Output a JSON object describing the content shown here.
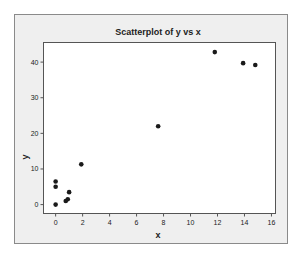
{
  "chart_data": {
    "type": "scatter",
    "title": "Scatterplot of y vs x",
    "xlabel": "x",
    "ylabel": "y",
    "xlim": [
      -0.9,
      16.3
    ],
    "ylim": [
      -2.5,
      45.5
    ],
    "xticks": [
      0,
      2,
      4,
      6,
      8,
      10,
      12,
      14,
      16
    ],
    "yticks": [
      0,
      10,
      20,
      30,
      40
    ],
    "grid": false,
    "legend": null,
    "series": [
      {
        "name": "y vs x",
        "points": [
          {
            "x": 0,
            "y": 6.5
          },
          {
            "x": 0,
            "y": 5
          },
          {
            "x": 0,
            "y": 0
          },
          {
            "x": 0.75,
            "y": 1
          },
          {
            "x": 0.9,
            "y": 1.5
          },
          {
            "x": 1,
            "y": 3.5
          },
          {
            "x": 1.9,
            "y": 11.3
          },
          {
            "x": 7.6,
            "y": 22
          },
          {
            "x": 11.8,
            "y": 42.8
          },
          {
            "x": 13.9,
            "y": 39.7
          },
          {
            "x": 14.8,
            "y": 39.2
          }
        ]
      }
    ]
  },
  "colors": {
    "frame_bg": "#efefef",
    "plot_bg": "#ffffff",
    "axis": "#555555",
    "marker": "#1a1a1a",
    "text": "#222222"
  }
}
